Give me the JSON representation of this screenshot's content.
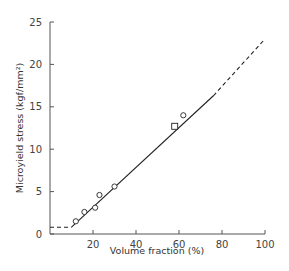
{
  "chart_data": {
    "type": "scatter",
    "title": "",
    "xlabel": "Volume fraction (%)",
    "ylabel": "Microyield stress (kgf/mm²)",
    "xlim": [
      0,
      100
    ],
    "ylim": [
      0,
      25
    ],
    "x_ticks": [
      20,
      40,
      60,
      80,
      100
    ],
    "x_tick_labels": [
      "20",
      "40",
      "60",
      "80",
      "100"
    ],
    "y_ticks": [
      0,
      5,
      10,
      15,
      20,
      25
    ],
    "y_tick_labels": [
      "0",
      "5",
      "10",
      "15",
      "20",
      "25"
    ],
    "grid": false,
    "legend": null,
    "series": [
      {
        "name": "circles",
        "marker": "open-circle",
        "x": [
          12,
          16,
          21,
          23,
          30,
          62
        ],
        "y": [
          1.5,
          2.6,
          3.1,
          4.6,
          5.6,
          14.0
        ]
      },
      {
        "name": "square",
        "marker": "open-square",
        "x": [
          58
        ],
        "y": [
          12.7
        ]
      }
    ],
    "fit_lines": [
      {
        "name": "baseline",
        "style": "dashed",
        "x": [
          0,
          10
        ],
        "y": [
          0.8,
          0.8
        ]
      },
      {
        "name": "linear-fit",
        "style": "solid",
        "x": [
          10,
          76
        ],
        "y": [
          0.8,
          16.3
        ]
      },
      {
        "name": "extrapolation",
        "style": "dashed",
        "x": [
          76,
          100
        ],
        "y": [
          16.3,
          23.0
        ]
      }
    ]
  }
}
